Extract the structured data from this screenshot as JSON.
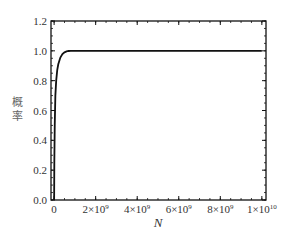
{
  "chart_data": {
    "type": "line",
    "title": "",
    "xlabel": "N",
    "ylabel": "概率",
    "xlim": [
      -150000000.0,
      10200000000.0
    ],
    "ylim": [
      0,
      1.2
    ],
    "x_ticks": [
      0,
      2000000000.0,
      4000000000.0,
      6000000000.0,
      8000000000.0,
      10000000000.0
    ],
    "x_tick_labels": [
      {
        "base": "0",
        "exp": ""
      },
      {
        "base": "2×10",
        "exp": "9"
      },
      {
        "base": "4×10",
        "exp": "9"
      },
      {
        "base": "6×10",
        "exp": "9"
      },
      {
        "base": "8×10",
        "exp": "9"
      },
      {
        "base": "1×10",
        "exp": "10"
      }
    ],
    "y_ticks": [
      0.0,
      0.2,
      0.4,
      0.6,
      0.8,
      1.0,
      1.2
    ],
    "y_tick_labels": [
      "0.0",
      "0.2",
      "0.4",
      "0.6",
      "0.8",
      "1.0",
      "1.2"
    ],
    "grid": false,
    "legend": null,
    "series": [
      {
        "name": "probability",
        "color": "#111111",
        "x": [
          0,
          10000000.0,
          30000000.0,
          60000000.0,
          100000000.0,
          150000000.0,
          200000000.0,
          300000000.0,
          400000000.0,
          500000000.0,
          600000000.0,
          700000000.0,
          800000000.0,
          1000000000.0,
          2000000000.0,
          4000000000.0,
          6000000000.0,
          8000000000.0,
          10000000000.0
        ],
        "y": [
          0.0,
          0.25,
          0.5,
          0.7,
          0.8,
          0.87,
          0.91,
          0.955,
          0.978,
          0.99,
          0.996,
          0.999,
          1.0,
          1.0,
          1.0,
          1.0,
          1.0,
          1.0,
          1.0
        ]
      }
    ]
  }
}
